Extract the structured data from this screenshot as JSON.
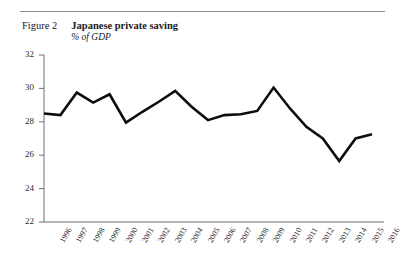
{
  "figure": {
    "label": "Figure 2",
    "title": "Japanese private saving",
    "subtitle": "% of GDP"
  },
  "colors": {
    "line": "#0d0d0d",
    "axis": "#6f6f6f",
    "rule": "#8d8d8d",
    "text": "#1a1a1a",
    "background": "#ffffff"
  },
  "chart_data": {
    "type": "line",
    "title": "Japanese private saving",
    "subtitle": "% of GDP",
    "xlabel": "",
    "ylabel": "% of GDP",
    "ylim": [
      22,
      32
    ],
    "yticks": [
      22,
      24,
      26,
      28,
      30,
      32
    ],
    "grid": false,
    "legend": "none",
    "categories": [
      "1996",
      "1997",
      "1998",
      "1999",
      "2000",
      "2001",
      "2002",
      "2003",
      "2004",
      "2005",
      "2006",
      "2007",
      "2008",
      "2009",
      "2010",
      "2011",
      "2012",
      "2013",
      "2014",
      "2015",
      "2016"
    ],
    "values": [
      28.5,
      28.4,
      29.75,
      29.15,
      29.65,
      27.95,
      28.6,
      29.2,
      29.85,
      28.9,
      28.1,
      28.4,
      28.45,
      28.65,
      30.05,
      28.8,
      27.7,
      27.0,
      25.65,
      27.0,
      27.25
    ],
    "series": [
      {
        "name": "Japanese private saving",
        "values": [
          28.5,
          28.4,
          29.75,
          29.15,
          29.65,
          27.95,
          28.6,
          29.2,
          29.85,
          28.9,
          28.1,
          28.4,
          28.45,
          28.65,
          30.05,
          28.8,
          27.7,
          27.0,
          25.65,
          27.0,
          27.25
        ]
      }
    ]
  }
}
